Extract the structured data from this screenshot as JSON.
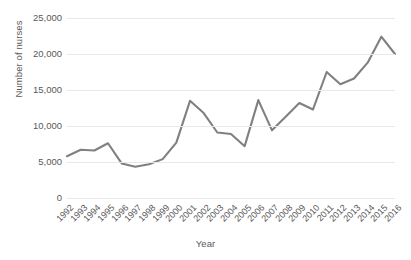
{
  "chart_data": {
    "type": "line",
    "title": "",
    "xlabel": "Year",
    "ylabel": "Number of nurses",
    "categories": [
      "1992",
      "1993",
      "1994",
      "1995",
      "1996",
      "1997",
      "1998",
      "1999",
      "2000",
      "2001",
      "2002",
      "2003",
      "2004",
      "2005",
      "2006",
      "2007",
      "2008",
      "2009",
      "2010",
      "2011",
      "2012",
      "2013",
      "2014",
      "2015",
      "2016"
    ],
    "values": [
      5800,
      6700,
      6600,
      7600,
      4800,
      4350,
      4700,
      5400,
      7700,
      13500,
      11800,
      9100,
      8900,
      7200,
      13600,
      9400,
      11300,
      13200,
      12300,
      17500,
      15800,
      16600,
      18800,
      22400,
      20000
    ],
    "series": [
      {
        "name": "Number of nurses",
        "values": [
          5800,
          6700,
          6600,
          7600,
          4800,
          4350,
          4700,
          5400,
          7700,
          13500,
          11800,
          9100,
          8900,
          7200,
          13600,
          9400,
          11300,
          13200,
          12300,
          17500,
          15800,
          16600,
          18800,
          22400,
          20000
        ]
      }
    ],
    "ylim": [
      0,
      25000
    ],
    "ytick_labels": [
      "0",
      "5,000",
      "10,000",
      "15,000",
      "20,000",
      "25,000"
    ],
    "ytick_values": [
      0,
      5000,
      10000,
      15000,
      20000,
      25000
    ],
    "grid": true,
    "grid_axis": "y",
    "legend": false,
    "legend_position": "none",
    "line_color": "#808080",
    "grid_color": "#e8e8e8",
    "text_color": "#595959",
    "background_color": "#ffffff",
    "xtick_rotation": -45
  }
}
